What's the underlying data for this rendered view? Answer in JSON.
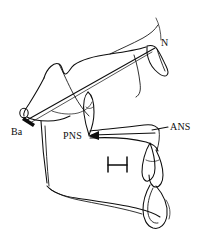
{
  "figure": {
    "kind": "cephalometric-tracing",
    "background_color": "#ffffff",
    "ink_color": "#0d0d0d",
    "width": 208,
    "height": 239
  },
  "landmarks": [
    {
      "id": "Ba",
      "label": "Ba",
      "name": "basion",
      "label_x": 11,
      "label_y": 127,
      "point_x": 24,
      "point_y": 113
    },
    {
      "id": "N",
      "label": "N",
      "name": "nasion",
      "label_x": 161,
      "label_y": 38,
      "point_x": 158,
      "point_y": 48
    },
    {
      "id": "PNS",
      "label": "PNS",
      "name": "posterior-nasal-spine",
      "label_x": 63,
      "label_y": 131,
      "point_x": 88,
      "point_y": 136
    },
    {
      "id": "ANS",
      "label": "ANS",
      "name": "anterior-nasal-spine",
      "label_x": 170,
      "label_y": 122,
      "point_x": 158,
      "point_y": 131
    }
  ],
  "reference_lines": [
    {
      "id": "ba-n",
      "name": "cranial-base-line",
      "from": "Ba",
      "to": "N"
    },
    {
      "id": "ans-pns",
      "name": "palatal-plane",
      "from": "ANS",
      "to": "PNS"
    }
  ],
  "annotations": [
    {
      "id": "hyoid-mark",
      "name": "hyoid-bone-mark",
      "glyph": "H",
      "x": 108,
      "y": 159
    }
  ]
}
